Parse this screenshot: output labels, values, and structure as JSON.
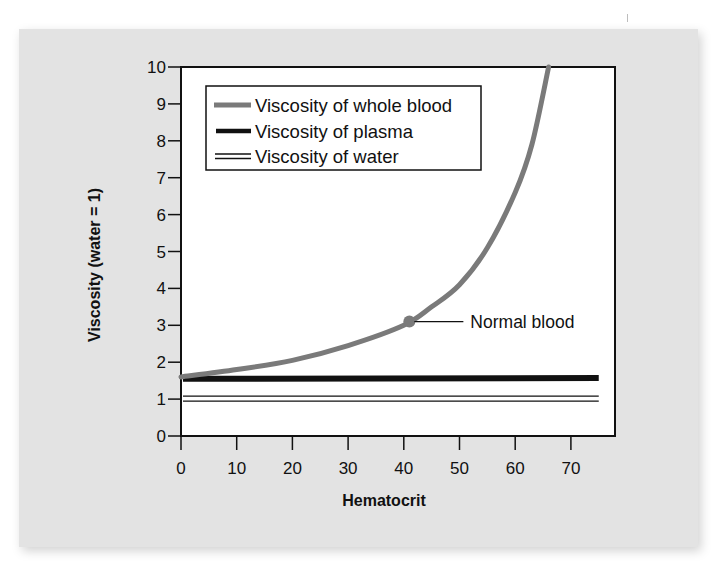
{
  "chart_data": {
    "type": "line",
    "title": "",
    "xlabel": "Hematocrit",
    "ylabel": "Viscosity (water = 1)",
    "xlim": [
      0,
      75
    ],
    "ylim": [
      0,
      10
    ],
    "x_ticks": [
      "0",
      "10",
      "20",
      "30",
      "40",
      "50",
      "60",
      "70"
    ],
    "y_ticks": [
      "0",
      "1",
      "2",
      "3",
      "4",
      "5",
      "6",
      "7",
      "8",
      "9",
      "10"
    ],
    "grid": false,
    "legend_position": "upper-left (inside plot)",
    "series": [
      {
        "name": "Viscosity of whole blood",
        "style": "thick gray line",
        "color": "#7a7a7a",
        "x": [
          0,
          10,
          20,
          30,
          40,
          45,
          50,
          55,
          60,
          63,
          66
        ],
        "values": [
          1.6,
          1.8,
          2.05,
          2.45,
          3.0,
          3.5,
          4.1,
          5.1,
          6.6,
          7.9,
          10.0
        ]
      },
      {
        "name": "Viscosity of plasma",
        "style": "thick black line",
        "color": "#111111",
        "x": [
          0,
          75
        ],
        "values": [
          1.55,
          1.57
        ]
      },
      {
        "name": "Viscosity of water",
        "style": "thin double black line",
        "color": "#111111",
        "x": [
          0,
          75
        ],
        "values": [
          1.0,
          1.0
        ]
      }
    ],
    "annotations": [
      {
        "text": "Normal blood",
        "x": 41,
        "y": 3.1,
        "marker": "gray dot on whole-blood curve"
      }
    ]
  },
  "labels": {
    "xlabel": "Hematocrit",
    "ylabel": "Viscosity (water = 1)",
    "legend": [
      "Viscosity of whole blood",
      "Viscosity of plasma",
      "Viscosity of water"
    ],
    "annotation": "Normal blood"
  },
  "colors": {
    "panel_background": "#e3e3e3",
    "plot_background": "#ffffff",
    "blood_curve": "#7a7a7a",
    "axis": "#111111"
  }
}
